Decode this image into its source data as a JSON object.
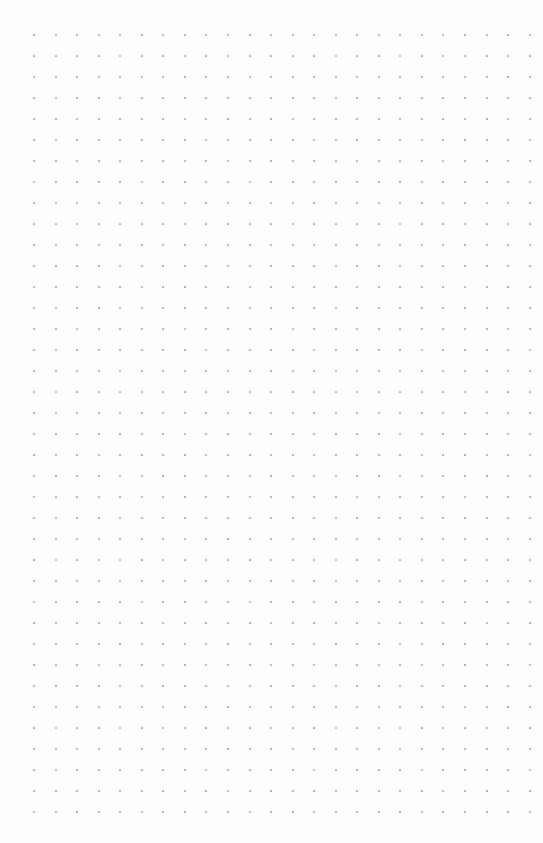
{
  "page": {
    "width": 543,
    "height": 843,
    "background_color": "#fefefe",
    "content_text": "",
    "annotations": []
  },
  "grid": {
    "kind": "dot-grid",
    "dot_color": "#9a9aa6",
    "dot_size_px": 2,
    "dot_opacity": 0.78,
    "spacing_x_px": 21.55,
    "spacing_y_px": 21.0,
    "origin_x_px": 33,
    "origin_y_px": 34,
    "columns": 24,
    "rows": 38,
    "total_dots": 912
  },
  "margins": {
    "top_px": 34,
    "bottom_px": 32,
    "left_px": 33,
    "right_px": 14
  }
}
